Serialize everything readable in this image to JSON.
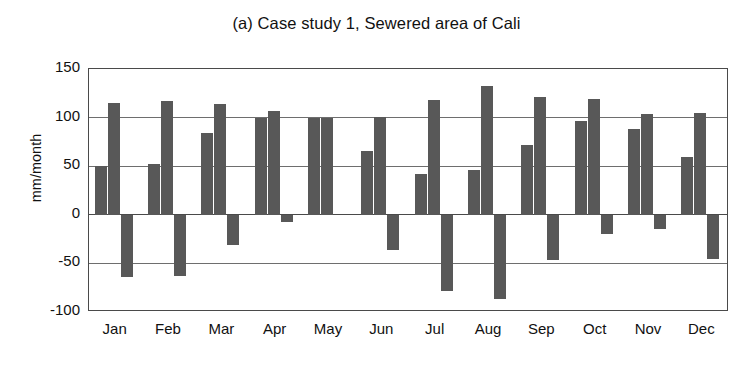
{
  "figure": {
    "panel_label": "(a)",
    "title": "(a) Case study 1, Sewered area of Cali",
    "background": "#ffffff"
  },
  "axes": {
    "y_title": "mm/month",
    "x_title": "",
    "y_ticks": [
      "150",
      "100",
      "50",
      "0",
      "-50",
      "-100"
    ],
    "y_tick_values": [
      150,
      100,
      50,
      0,
      -50,
      -100
    ],
    "x_ticks": [
      "Jan",
      "Feb",
      "Mar",
      "Apr",
      "May",
      "Jun",
      "Jul",
      "Aug",
      "Sep",
      "Oct",
      "Nov",
      "Dec"
    ]
  },
  "style": {
    "bar_color": "#585858",
    "frame_color": "#4a4a4a",
    "gridline_color": "#6e6e6e",
    "text_color": "#111111"
  },
  "chart_data": {
    "type": "bar",
    "title": "(a) Case study 1, Sewered area of Cali",
    "xlabel": "",
    "ylabel": "mm/month",
    "ylim": [
      -100,
      150
    ],
    "ytick_interval": 50,
    "grid": true,
    "legend": "none",
    "orientation": "vertical",
    "grouping": "grouped",
    "categories": [
      "Jan",
      "Feb",
      "Mar",
      "Apr",
      "May",
      "Jun",
      "Jul",
      "Aug",
      "Sep",
      "Oct",
      "Nov",
      "Dec"
    ],
    "series": [
      {
        "name": "series-1",
        "values": [
          50,
          52,
          84,
          100,
          100,
          66,
          42,
          46,
          72,
          97,
          88,
          59
        ]
      },
      {
        "name": "series-2",
        "values": [
          115,
          117,
          114,
          107,
          100,
          101,
          118,
          132,
          121,
          119,
          104,
          105
        ]
      },
      {
        "name": "series-3",
        "values": [
          -64,
          -63,
          -31,
          -7,
          0,
          -36,
          -78,
          -87,
          -46,
          -20,
          -15,
          -45
        ]
      }
    ]
  }
}
